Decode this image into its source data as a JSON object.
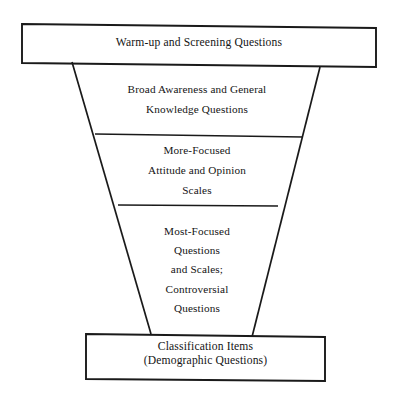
{
  "diagram": {
    "type": "funnel",
    "stroke_color": "#1a1a1a",
    "background_color": "#ffffff",
    "top_box": {
      "lines": [
        "Warm-up and Screening Questions"
      ]
    },
    "stage_broad": {
      "lines": [
        "Broad Awareness and General",
        "Knowledge Questions"
      ]
    },
    "stage_focused": {
      "lines": [
        "More-Focused",
        "Attitude and Opinion",
        "Scales"
      ]
    },
    "stage_most_focused": {
      "lines": [
        "Most-Focused",
        "Questions",
        "and Scales;",
        "Controversial",
        "Questions"
      ]
    },
    "bottom_box": {
      "lines": [
        "Classification Items",
        "(Demographic Questions)"
      ]
    }
  }
}
